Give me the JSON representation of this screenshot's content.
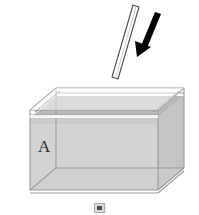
{
  "figure": {
    "background_color": "#ffffff",
    "labels": {
      "liquid_label": "A"
    },
    "colors": {
      "liquid_fill": "#d2d2d2",
      "liquid_surface_band": "#b9b9b9",
      "liquid_far_wall": "#c6c6c6",
      "tank_outline": "#9a9a9a",
      "tank_rim": "#f4f4f4",
      "rod_fill": "#ffffff",
      "rod_outline": "#4a4a4a",
      "arrow_color": "#000000",
      "label_color": "#2b2b2b"
    },
    "tank": {
      "name": "open-top rectangular tank",
      "front_face": {
        "top_left": [
          28,
          108
        ],
        "top_right": [
          160,
          108
        ],
        "bottom_right": [
          160,
          192
        ],
        "bottom_left": [
          28,
          192
        ]
      },
      "back_top_left": [
        50,
        86
      ],
      "back_top_right": [
        186,
        86
      ],
      "back_bottom_right": [
        186,
        170
      ],
      "rim_thickness": 5
    },
    "liquid": {
      "name": "liquid body labeled A",
      "surface_front_y": 118,
      "surface_back_y": 96,
      "fill_bottom_y": 192,
      "label_position": [
        38,
        148
      ]
    },
    "rod": {
      "name": "rod above tank",
      "top_point": [
        136,
        6
      ],
      "bottom_point": [
        113,
        78
      ],
      "width": 7,
      "tilt_degrees": 18
    },
    "arrow": {
      "name": "downward insertion arrow",
      "tail": [
        158,
        13
      ],
      "head": [
        138,
        54
      ],
      "shaft_width": 6,
      "head_width": 15,
      "head_length": 14,
      "direction": "down-left"
    },
    "page_marker": {
      "name": "small page marker glyph",
      "position": [
        94,
        203
      ],
      "size": [
        11,
        10
      ]
    }
  }
}
